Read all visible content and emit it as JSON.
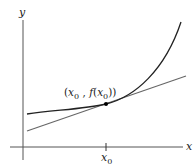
{
  "diagram": {
    "axes": {
      "x_label": "x",
      "y_label": "y"
    },
    "tick": {
      "label_base": "x",
      "label_sub": "0"
    },
    "point_label": {
      "open": "(",
      "x_base": "x",
      "x_sub": "0",
      "sep": " , ",
      "f": "f",
      "paren_open": "(",
      "fx_base": "x",
      "fx_sub": "0",
      "close": "))"
    },
    "elements": [
      {
        "name": "curve",
        "description": "convex increasing curve y = f(x)",
        "color": "#222222"
      },
      {
        "name": "tangent-line",
        "description": "tangent line at (x0, f(x0))",
        "color": "#666666"
      },
      {
        "name": "tangent-point",
        "description": "point (x0, f(x0))",
        "color": "#000000"
      }
    ]
  }
}
